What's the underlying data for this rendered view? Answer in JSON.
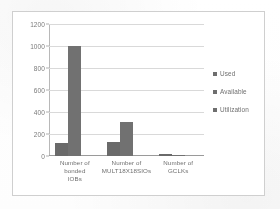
{
  "chart_data": {
    "type": "bar",
    "title": "",
    "xlabel": "",
    "ylabel": "",
    "ylim": [
      0,
      1200
    ],
    "yticks": [
      0,
      200,
      400,
      600,
      800,
      1000,
      1200
    ],
    "ytick_labels": [
      "0",
      "200",
      "400",
      "600",
      "800",
      "1000",
      "1200"
    ],
    "grid": true,
    "legend_position": "right",
    "categories": [
      "Number of bonded IOBs",
      "Number of MULT18X18SIOs",
      "Number of GCLKs"
    ],
    "series": [
      {
        "name": "Used",
        "color": "#6a6a6a",
        "values": [
          120,
          128,
          16
        ]
      },
      {
        "name": "Available",
        "color": "#717171",
        "values": [
          1000,
          312,
          8
        ]
      },
      {
        "name": "Utilization",
        "color": "#7a7a7a",
        "values": [
          0,
          0,
          0
        ]
      }
    ]
  },
  "legend": {
    "items": [
      {
        "label": "Used"
      },
      {
        "label": "Available"
      },
      {
        "label": "Utilization"
      }
    ]
  },
  "axis": {
    "y_labels": [
      "1200",
      "1000",
      "800",
      "600",
      "400",
      "200",
      "0"
    ]
  },
  "categories": {
    "c0_line1": "Number of bonded",
    "c0_line2": "IOBs",
    "c1_line1": "Number of",
    "c1_line2": "MULT18X18SIOs",
    "c2_line1": "Number of GCLKs",
    "c2_line2": ""
  }
}
